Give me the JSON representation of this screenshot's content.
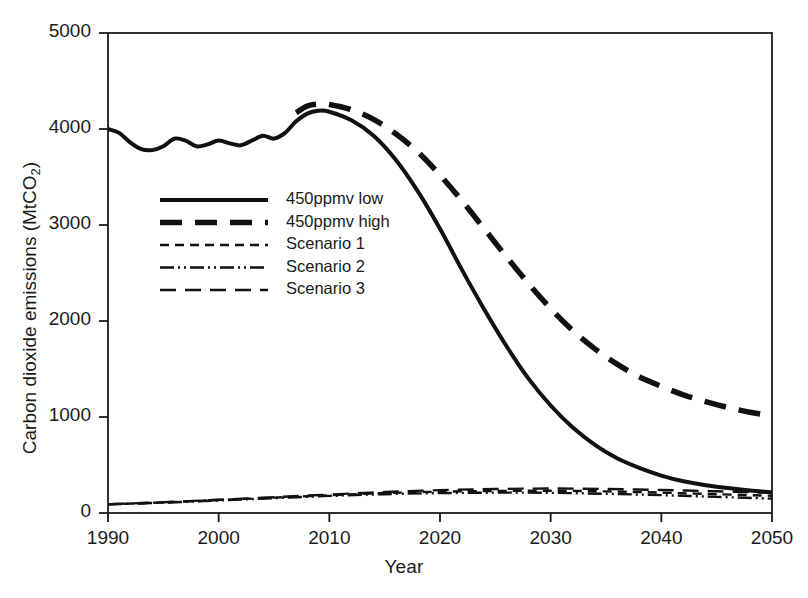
{
  "chart_data": {
    "type": "line",
    "title": "",
    "xlabel": "Year",
    "ylabel": "Carbon dioxide emissions (MtCO2)",
    "ylabel_base": "Carbon dioxide emissions (MtCO",
    "ylabel_sub": "2",
    "ylabel_tail": ")",
    "xlim": [
      1990,
      2050
    ],
    "ylim": [
      0,
      5000
    ],
    "xticks": [
      1990,
      2000,
      2010,
      2020,
      2030,
      2040,
      2050
    ],
    "xtick_labels": [
      "1990",
      "2000",
      "2010",
      "2020",
      "2030",
      "2040",
      "2050"
    ],
    "yticks": [
      0,
      1000,
      2000,
      3000,
      4000,
      5000
    ],
    "ytick_labels": [
      "0",
      "1000",
      "2000",
      "3000",
      "4000",
      "5000"
    ],
    "grid": false,
    "legend_position": "upper-left-inside",
    "line_color": "#111111",
    "series": [
      {
        "name": "450ppmv low",
        "style": "solid",
        "dash": "none",
        "width": 4.0,
        "x": [
          1990,
          1991,
          1992,
          1993,
          1994,
          1995,
          1996,
          1997,
          1998,
          1999,
          2000,
          2001,
          2002,
          2003,
          2004,
          2005,
          2006,
          2007,
          2008,
          2009,
          2010,
          2012,
          2014,
          2016,
          2018,
          2020,
          2022,
          2024,
          2026,
          2028,
          2030,
          2032,
          2034,
          2036,
          2038,
          2040,
          2042,
          2044,
          2046,
          2048,
          2050
        ],
        "y": [
          4000,
          3960,
          3860,
          3790,
          3780,
          3820,
          3900,
          3880,
          3820,
          3840,
          3880,
          3850,
          3830,
          3880,
          3930,
          3900,
          3960,
          4080,
          4160,
          4190,
          4180,
          4090,
          3930,
          3680,
          3350,
          2960,
          2530,
          2120,
          1740,
          1400,
          1120,
          890,
          710,
          570,
          470,
          390,
          330,
          290,
          260,
          235,
          215
        ]
      },
      {
        "name": "450ppmv high",
        "style": "dashed",
        "dash": "22,13",
        "width": 5.5,
        "x": [
          2007,
          2008,
          2009,
          2010,
          2012,
          2014,
          2016,
          2018,
          2020,
          2022,
          2024,
          2026,
          2028,
          2030,
          2032,
          2034,
          2036,
          2038,
          2040,
          2042,
          2044,
          2046,
          2048,
          2050
        ],
        "y": [
          4170,
          4240,
          4260,
          4255,
          4200,
          4100,
          3950,
          3760,
          3520,
          3250,
          2960,
          2670,
          2390,
          2130,
          1900,
          1710,
          1550,
          1420,
          1320,
          1230,
          1160,
          1100,
          1050,
          1010
        ]
      },
      {
        "name": "Scenario 1",
        "style": "short-dashed",
        "dash": "9,6",
        "width": 2.4,
        "x": [
          1990,
          1995,
          2000,
          2005,
          2010,
          2015,
          2020,
          2025,
          2030,
          2035,
          2040,
          2045,
          2050
        ],
        "y": [
          90,
          110,
          135,
          160,
          185,
          208,
          222,
          230,
          232,
          225,
          212,
          196,
          180
        ]
      },
      {
        "name": "Scenario 2",
        "style": "dash-dot-dot",
        "dash": "14,4,2,4,2,4",
        "width": 2.4,
        "x": [
          1990,
          1995,
          2000,
          2005,
          2010,
          2015,
          2020,
          2025,
          2030,
          2035,
          2040,
          2045,
          2050
        ],
        "y": [
          90,
          108,
          130,
          155,
          178,
          196,
          207,
          212,
          210,
          200,
          186,
          168,
          150
        ]
      },
      {
        "name": "Scenario 3",
        "style": "medium-dashed",
        "dash": "16,9",
        "width": 2.4,
        "x": [
          1990,
          1995,
          2000,
          2005,
          2010,
          2015,
          2020,
          2025,
          2030,
          2035,
          2040,
          2045,
          2050
        ],
        "y": [
          92,
          112,
          138,
          165,
          192,
          218,
          238,
          250,
          255,
          250,
          240,
          226,
          212
        ]
      }
    ],
    "legend": [
      {
        "label": "450ppmv low",
        "style": "solid"
      },
      {
        "label": "450ppmv high",
        "style": "dashed"
      },
      {
        "label": "Scenario 1",
        "style": "short-dashed"
      },
      {
        "label": "Scenario 2",
        "style": "dash-dot-dot"
      },
      {
        "label": "Scenario 3",
        "style": "medium-dashed"
      }
    ]
  }
}
